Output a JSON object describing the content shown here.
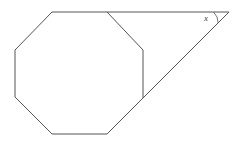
{
  "figure": {
    "canvas": {
      "width": 240,
      "height": 143,
      "background": "#ffffff"
    },
    "stroke_color": "#555555",
    "label_color": "#444444",
    "octagon": {
      "name": "regular-octagon",
      "points": "52,12 107,12 143,50 143,98 107,134 52,134 15,97 15,50",
      "vertices": [
        {
          "label": "top-left",
          "x": 52,
          "y": 12
        },
        {
          "label": "top-right",
          "x": 107,
          "y": 12
        },
        {
          "label": "upper-right",
          "x": 143,
          "y": 50
        },
        {
          "label": "lower-right",
          "x": 143,
          "y": 98
        },
        {
          "label": "bottom-right",
          "x": 107,
          "y": 134
        },
        {
          "label": "bottom-left",
          "x": 52,
          "y": 134
        },
        {
          "label": "lower-left",
          "x": 15,
          "y": 97
        },
        {
          "label": "upper-left",
          "x": 15,
          "y": 50
        }
      ]
    },
    "triangle": {
      "name": "extension-triangle",
      "top_edge": {
        "x1": 107,
        "y1": 12,
        "x2": 229,
        "y2": 12
      },
      "hypotenuse": {
        "x1": 229,
        "y1": 12,
        "x2": 143,
        "y2": 98
      },
      "apex": {
        "x": 229,
        "y": 12
      }
    },
    "angle_mark": {
      "name": "angle-x",
      "label": "x",
      "label_x": 206,
      "label_y": 19,
      "arc_path": "M 213.5 12 A 15.5 15.5 0 0 1 218.2 23.0"
    }
  }
}
